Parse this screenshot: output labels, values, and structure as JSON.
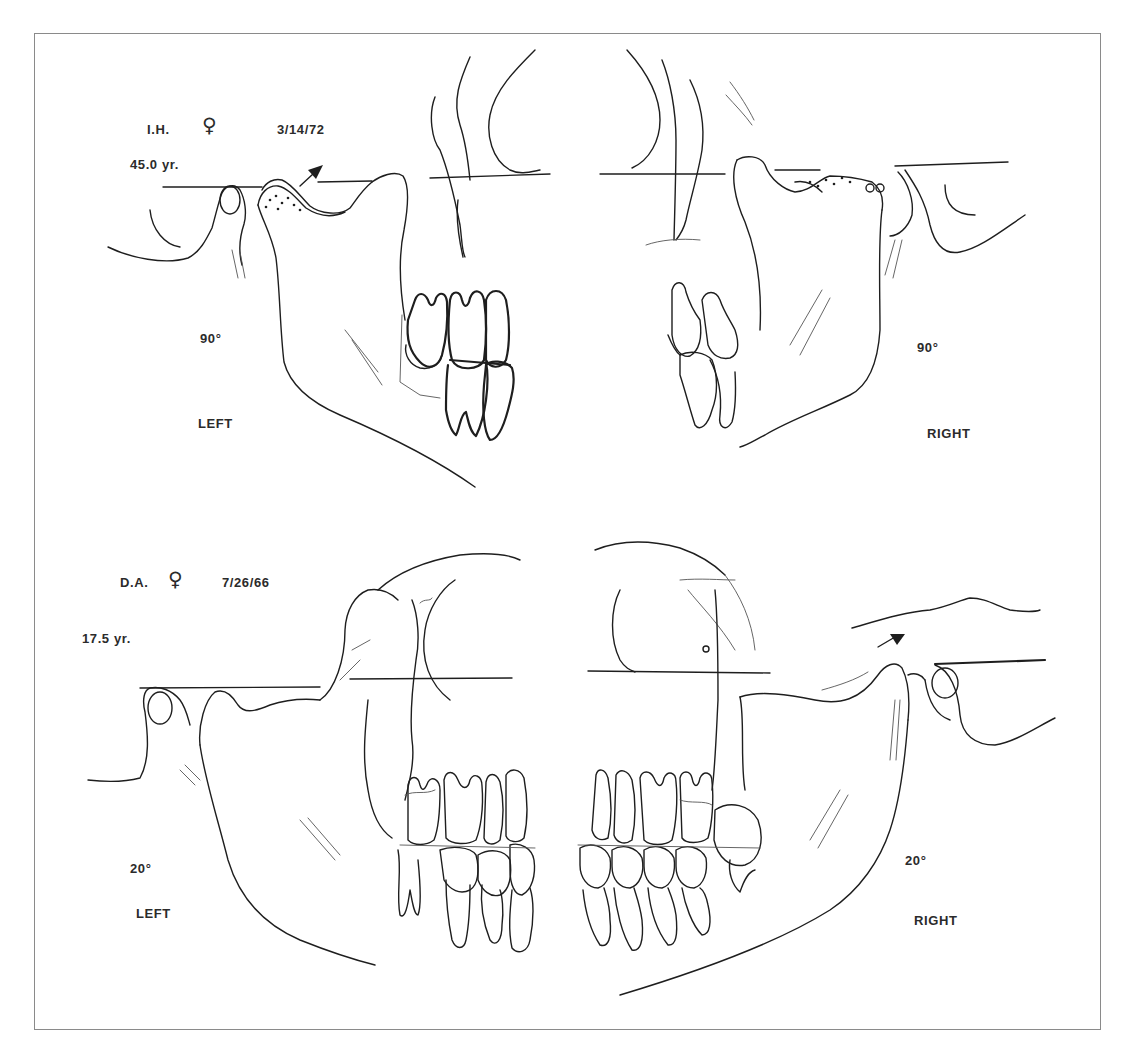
{
  "figure": {
    "panels": [
      {
        "id": "top",
        "patient": "I.H.",
        "sex_symbol": "♀",
        "date": "3/14/72",
        "age": "45.0 yr.",
        "left": {
          "angle": "90°",
          "side": "LEFT"
        },
        "right": {
          "angle": "90°",
          "side": "RIGHT"
        }
      },
      {
        "id": "bottom",
        "patient": "D.A.",
        "sex_symbol": "♀",
        "date": "7/26/66",
        "age": "17.5 yr.",
        "left": {
          "angle": "20°",
          "side": "LEFT"
        },
        "right": {
          "angle": "20°",
          "side": "RIGHT"
        }
      }
    ]
  }
}
